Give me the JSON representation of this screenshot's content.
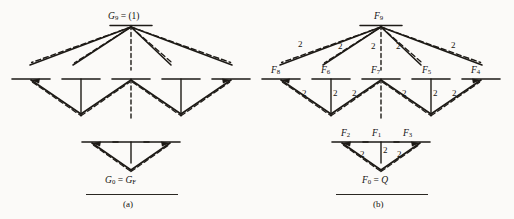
{
  "figure": {
    "background_color": "#fbfaf8",
    "ink_color": "#14120f",
    "panels": [
      {
        "id": "a",
        "caption": "(a)",
        "top_node": {
          "name": "node-g9",
          "label_main": "G",
          "label_sub": "9",
          "label_eq": " = ",
          "label_rest": "(1)"
        },
        "bottom_node": {
          "name": "node-g0",
          "label_main": "G",
          "label_sub": "0",
          "label_eq": " = ",
          "label_rest": "G",
          "label_rest_sub": "F"
        },
        "edge_labels": [],
        "row_counts": {
          "top_fan": 5,
          "middle_nodes": 5,
          "bottom_nodes": 3
        }
      },
      {
        "id": "b",
        "caption": "(b)",
        "top_node": {
          "name": "node-f9",
          "label_main": "F",
          "label_sub": "9"
        },
        "bottom_node": {
          "name": "node-f0",
          "label_main": "F",
          "label_sub": "0",
          "label_eq": " = ",
          "label_rest": "Q"
        },
        "middle_nodes": [
          {
            "name": "node-f8",
            "label_main": "F",
            "label_sub": "8"
          },
          {
            "name": "node-f6",
            "label_main": "F",
            "label_sub": "6"
          },
          {
            "name": "node-f7",
            "label_main": "F",
            "label_sub": "7"
          },
          {
            "name": "node-f5",
            "label_main": "F",
            "label_sub": "5"
          },
          {
            "name": "node-f4",
            "label_main": "F",
            "label_sub": "4"
          }
        ],
        "lower_nodes": [
          {
            "name": "node-f2",
            "label_main": "F",
            "label_sub": "2"
          },
          {
            "name": "node-f1",
            "label_main": "F",
            "label_sub": "1"
          },
          {
            "name": "node-f3",
            "label_main": "F",
            "label_sub": "3"
          }
        ],
        "edge_weight": "2",
        "edge_labels_top_fan": [
          "2",
          "2",
          "2",
          "2",
          "2"
        ],
        "edge_labels_middle_row": [
          "2",
          "2",
          "2",
          "2",
          "2",
          "2",
          "2"
        ],
        "edge_labels_bottom_row": [
          "2",
          "2",
          "2"
        ],
        "row_counts": {
          "top_fan": 5,
          "middle_nodes": 5,
          "bottom_nodes": 3
        }
      }
    ]
  }
}
